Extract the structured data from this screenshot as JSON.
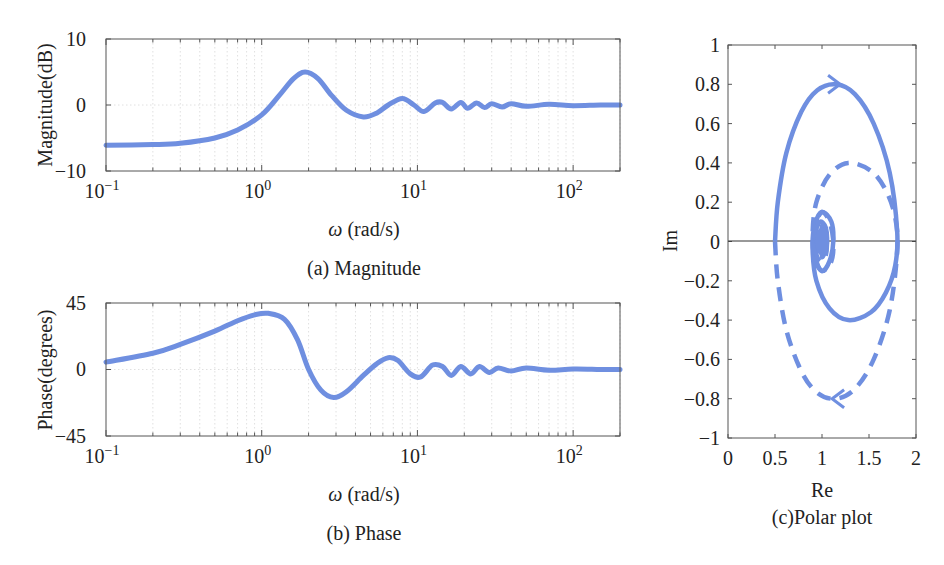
{
  "figure": {
    "line_color": "#6F8FE0",
    "panels": {
      "magnitude": {
        "ylabel": "Magnitude(dB)",
        "xlabel_symbol": "ω",
        "xlabel_unit": "(rad/s)",
        "caption": "(a) Magnitude",
        "yticks": [
          "10",
          "0",
          "−10"
        ],
        "xticks": [
          {
            "base": "10",
            "exp": "−1"
          },
          {
            "base": "10",
            "exp": "0"
          },
          {
            "base": "10",
            "exp": "1"
          },
          {
            "base": "10",
            "exp": "2"
          }
        ]
      },
      "phase": {
        "ylabel": "Phase(degrees)",
        "xlabel_symbol": "ω",
        "xlabel_unit": "(rad/s)",
        "caption": "(b) Phase",
        "yticks": [
          "45",
          "0",
          "−45"
        ],
        "xticks": [
          {
            "base": "10",
            "exp": "−1"
          },
          {
            "base": "10",
            "exp": "0"
          },
          {
            "base": "10",
            "exp": "1"
          },
          {
            "base": "10",
            "exp": "2"
          }
        ]
      },
      "polar": {
        "ylabel": "Im",
        "xlabel": "Re",
        "caption": "(c)Polar plot",
        "yticks": [
          "1",
          "0.8",
          "0.6",
          "0.4",
          "0.2",
          "0",
          "−0.2",
          "−0.4",
          "−0.6",
          "−0.8",
          "−1"
        ],
        "xticks": [
          "0",
          "0.5",
          "1",
          "1.5",
          "2"
        ]
      }
    }
  },
  "chart_data": [
    {
      "type": "line",
      "title": "(a) Magnitude",
      "xlabel": "ω (rad/s)",
      "ylabel": "Magnitude(dB)",
      "xscale": "log",
      "xlim": [
        0.1,
        200
      ],
      "ylim": [
        -10,
        10
      ],
      "grid": true,
      "series": [
        {
          "name": "Magnitude",
          "x": [
            0.1,
            0.2,
            0.3,
            0.5,
            0.7,
            1.0,
            1.3,
            1.6,
            1.9,
            2.3,
            2.8,
            3.5,
            4.5,
            5.5,
            6.5,
            8.0,
            9.5,
            11.0,
            13.0,
            14.5,
            16.5,
            19.0,
            21.0,
            24.0,
            27.0,
            30.0,
            35.0,
            40.0,
            50.0,
            70.0,
            100.0,
            150.0,
            200.0
          ],
          "y": [
            -6.1,
            -6.0,
            -5.8,
            -5.0,
            -3.8,
            -1.5,
            1.5,
            4.0,
            5.0,
            4.0,
            1.5,
            -0.8,
            -1.8,
            -1.2,
            0.0,
            1.0,
            0.0,
            -1.0,
            0.3,
            0.4,
            -0.6,
            0.4,
            -0.5,
            0.3,
            -0.4,
            0.2,
            -0.3,
            0.2,
            -0.2,
            0.1,
            -0.1,
            0.0,
            0.0
          ]
        }
      ]
    },
    {
      "type": "line",
      "title": "(b) Phase",
      "xlabel": "ω (rad/s)",
      "ylabel": "Phase(degrees)",
      "xscale": "log",
      "xlim": [
        0.1,
        200
      ],
      "ylim": [
        -45,
        45
      ],
      "grid": true,
      "series": [
        {
          "name": "Phase",
          "x": [
            0.1,
            0.2,
            0.3,
            0.5,
            0.7,
            0.9,
            1.1,
            1.4,
            1.7,
            2.0,
            2.4,
            2.9,
            3.5,
            4.5,
            5.5,
            6.5,
            7.5,
            9.0,
            10.5,
            12.5,
            14.5,
            16.5,
            19.0,
            22.0,
            25.0,
            29.0,
            33.0,
            40.0,
            50.0,
            70.0,
            100.0,
            150.0,
            200.0
          ],
          "y": [
            5,
            11,
            17,
            26,
            33,
            37,
            38,
            34,
            20,
            0,
            -14,
            -19,
            -15,
            -4,
            4,
            8,
            6,
            -3,
            -5,
            3,
            2,
            -4,
            2,
            -3,
            2,
            -2,
            1,
            -1,
            1,
            -0.5,
            0.3,
            0,
            0
          ]
        }
      ]
    },
    {
      "type": "line",
      "title": "(c)Polar plot",
      "xlabel": "Re",
      "ylabel": "Im",
      "xlim": [
        0,
        2
      ],
      "ylim": [
        -1,
        1
      ],
      "grid": false,
      "series": [
        {
          "name": "ω > 0 (solid)",
          "style": "solid",
          "x": [
            0.5,
            0.53,
            0.62,
            0.78,
            0.95,
            1.15,
            1.35,
            1.55,
            1.72,
            1.8,
            1.78,
            1.68,
            1.52,
            1.28,
            1.08,
            0.94,
            0.9,
            0.92,
            1.0,
            1.1,
            1.12,
            1.08,
            1.0,
            0.93,
            0.93,
            0.98,
            1.04,
            1.05,
            1.0,
            1.0
          ],
          "y": [
            0.0,
            0.2,
            0.45,
            0.66,
            0.77,
            0.8,
            0.75,
            0.6,
            0.35,
            0.05,
            -0.12,
            -0.26,
            -0.36,
            -0.4,
            -0.34,
            -0.2,
            -0.04,
            0.08,
            0.15,
            0.1,
            0.0,
            -0.1,
            -0.15,
            -0.08,
            0.04,
            0.1,
            0.07,
            -0.02,
            -0.08,
            0.0
          ]
        },
        {
          "name": "ω < 0 (dashed)",
          "style": "dashed",
          "x": [
            0.5,
            0.53,
            0.62,
            0.78,
            0.95,
            1.15,
            1.35,
            1.55,
            1.72,
            1.8,
            1.78,
            1.68,
            1.52,
            1.28,
            1.08,
            0.94,
            0.9,
            0.92,
            1.0,
            1.1,
            1.12,
            1.08,
            1.0,
            0.93,
            0.93,
            0.98,
            1.04,
            1.05,
            1.0,
            1.0
          ],
          "y": [
            0.0,
            -0.2,
            -0.45,
            -0.66,
            -0.77,
            -0.8,
            -0.75,
            -0.6,
            -0.35,
            -0.05,
            0.12,
            0.26,
            0.36,
            0.4,
            0.34,
            0.2,
            0.04,
            -0.08,
            -0.15,
            -0.1,
            0.0,
            0.1,
            0.15,
            0.08,
            -0.04,
            -0.1,
            -0.07,
            0.02,
            0.08,
            0.0
          ]
        }
      ],
      "annotations": [
        {
          "type": "arrow",
          "at": [
            1.15,
            0.8
          ],
          "direction": "right",
          "series": "solid"
        },
        {
          "type": "arrow",
          "at": [
            1.15,
            -0.8
          ],
          "direction": "left",
          "series": "dashed"
        }
      ]
    }
  ]
}
